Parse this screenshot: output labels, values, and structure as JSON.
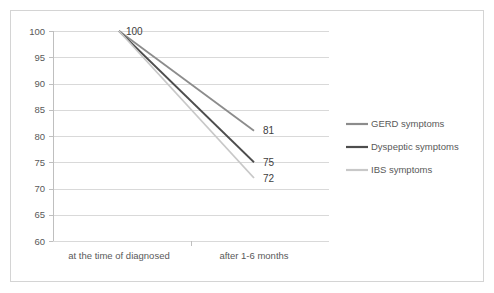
{
  "chart_data": {
    "type": "line",
    "title": "",
    "xlabel": "",
    "ylabel": "",
    "categories": [
      "at the time of diagnosed",
      "after 1-6 months"
    ],
    "ylim": [
      60,
      100
    ],
    "yticks": [
      60,
      65,
      70,
      75,
      80,
      85,
      90,
      95,
      100
    ],
    "grid": true,
    "legend_position": "right",
    "origin_label": "100",
    "series": [
      {
        "name": "GERD symptoms",
        "values": [
          100,
          81
        ],
        "end_label": "81",
        "color": "#8C8C8C"
      },
      {
        "name": "Dyspeptic symptoms",
        "values": [
          100,
          75
        ],
        "end_label": "75",
        "color": "#4D4D4D"
      },
      {
        "name": "IBS symptoms",
        "values": [
          100,
          72
        ],
        "end_label": "72",
        "color": "#C8C8C8"
      }
    ]
  },
  "axis": {
    "y_tick_labels": [
      "100",
      "95",
      "90",
      "85",
      "80",
      "75",
      "70",
      "65",
      "60"
    ],
    "category_labels": [
      "at the time of diagnosed",
      "after 1-6 months"
    ]
  },
  "legend": {
    "entries": [
      {
        "label": "GERD symptoms",
        "color": "#8C8C8C"
      },
      {
        "label": "Dyspeptic symptoms",
        "color": "#4D4D4D"
      },
      {
        "label": "IBS symptoms",
        "color": "#C8C8C8"
      }
    ]
  },
  "colors": {
    "gridline": "#D9D9D9",
    "axis": "#BFBFBF",
    "border": "#D4D4D4",
    "text": "#595959",
    "background": "#FFFFFF"
  }
}
